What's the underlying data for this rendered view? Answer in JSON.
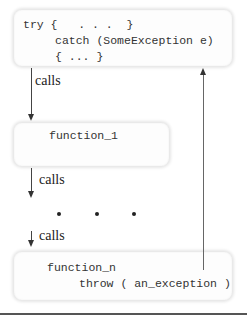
{
  "diagram": {
    "top_box": {
      "line1": "try {   . . .  }",
      "line2": "catch (SomeException e)",
      "line3": "{ ... }"
    },
    "calls_1": "calls",
    "function_1_box": {
      "label": "function_1"
    },
    "calls_2": "calls",
    "ellipsis_dots": 3,
    "calls_3": "calls",
    "function_n_box": {
      "line1": "function_n",
      "line2": "throw ( an_exception )"
    },
    "colors": {
      "line": "#444444",
      "box_bg": "#fdfdfd",
      "box_shadow": "#e6e6e6"
    }
  }
}
